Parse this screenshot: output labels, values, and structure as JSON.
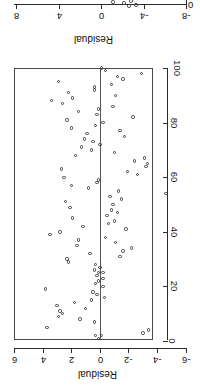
{
  "figure": {
    "orientation": "rotated-90-clockwise",
    "background": "#ffffff",
    "ink_color": "#2b2b2b",
    "marker_color": "#3a3a3a",
    "zero_line_color": "#555555"
  },
  "top_panel": {
    "note": "partially clipped plot at top of image",
    "axis_title": "Residual",
    "tick_labels": [
      "8",
      "4",
      "0",
      "-4",
      "-8"
    ],
    "tick_positions_px": [
      16,
      59,
      101,
      144,
      186
    ],
    "right_edge_label": "0",
    "points_px": [
      {
        "x": 113,
        "y": 2
      },
      {
        "x": 124,
        "y": 3
      },
      {
        "x": 129,
        "y": 6
      },
      {
        "x": 131,
        "y": 1
      },
      {
        "x": 136,
        "y": 5
      }
    ]
  },
  "main_panel": {
    "x_axis": {
      "title": "Residual",
      "tick_labels": [
        "6",
        "4",
        "2",
        "0",
        "-2",
        "-4",
        "-6"
      ],
      "tick_values": [
        6,
        4,
        2,
        0,
        -2,
        -4,
        -6
      ],
      "tick_positions_px": [
        14,
        43,
        71,
        100,
        128,
        157,
        186
      ],
      "range": [
        6,
        -6
      ]
    },
    "y_axis": {
      "title": "Case number",
      "tick_labels": [
        "100",
        "80",
        "60",
        "40",
        "20",
        "0"
      ],
      "tick_values": [
        100,
        80,
        60,
        40,
        20,
        0
      ],
      "tick_positions_px": [
        12,
        67,
        121,
        176,
        230,
        285
      ],
      "range": [
        100,
        0
      ]
    },
    "zero_reference_label": "0"
  },
  "chart_data": {
    "type": "scatter",
    "title": "",
    "xlabel": "Residual",
    "ylabel": "Case number",
    "xlim": [
      -6,
      6
    ],
    "ylim": [
      0,
      100
    ],
    "grid": false,
    "legend": null,
    "reference_line": {
      "axis": "residual",
      "value": 0
    },
    "series": [
      {
        "name": "residuals",
        "marker": "open-circle",
        "points": [
          {
            "case": 1,
            "residual": 0.1
          },
          {
            "case": 2,
            "residual": -0.1
          },
          {
            "case": 2,
            "residual": 0.3
          },
          {
            "case": 3,
            "residual": -3.0
          },
          {
            "case": 4,
            "residual": -3.4
          },
          {
            "case": 5,
            "residual": 3.7
          },
          {
            "case": 7,
            "residual": 0.4
          },
          {
            "case": 8,
            "residual": 1.4
          },
          {
            "case": 9,
            "residual": 2.9
          },
          {
            "case": 10,
            "residual": 2.6
          },
          {
            "case": 11,
            "residual": 2.8
          },
          {
            "case": 12,
            "residual": 1.0
          },
          {
            "case": 13,
            "residual": 3.0
          },
          {
            "case": 14,
            "residual": 1.8
          },
          {
            "case": 15,
            "residual": 0.6
          },
          {
            "case": 16,
            "residual": -0.3
          },
          {
            "case": 17,
            "residual": 0.2
          },
          {
            "case": 18,
            "residual": 0.5
          },
          {
            "case": 19,
            "residual": 3.8
          },
          {
            "case": 20,
            "residual": -0.2
          },
          {
            "case": 21,
            "residual": 0.3
          },
          {
            "case": 22,
            "residual": 0.1
          },
          {
            "case": 23,
            "residual": -0.2
          },
          {
            "case": 24,
            "residual": 0.2
          },
          {
            "case": 25,
            "residual": 0.1
          },
          {
            "case": 25,
            "residual": -0.2
          },
          {
            "case": 26,
            "residual": 0.4
          },
          {
            "case": 27,
            "residual": 0.0
          },
          {
            "case": 28,
            "residual": 0.3
          },
          {
            "case": 29,
            "residual": 2.2
          },
          {
            "case": 30,
            "residual": 2.3
          },
          {
            "case": 31,
            "residual": -1.4
          },
          {
            "case": 32,
            "residual": 0.7
          },
          {
            "case": 33,
            "residual": -1.6
          },
          {
            "case": 34,
            "residual": -2.2
          },
          {
            "case": 35,
            "residual": 1.6
          },
          {
            "case": 36,
            "residual": -1.1
          },
          {
            "case": 37,
            "residual": 1.5
          },
          {
            "case": 38,
            "residual": -0.4
          },
          {
            "case": 39,
            "residual": 3.5
          },
          {
            "case": 40,
            "residual": 2.8
          },
          {
            "case": 41,
            "residual": -1.8
          },
          {
            "case": 42,
            "residual": 1.2
          },
          {
            "case": 43,
            "residual": -0.6
          },
          {
            "case": 44,
            "residual": -1.0
          },
          {
            "case": 45,
            "residual": 1.9
          },
          {
            "case": 46,
            "residual": -0.5
          },
          {
            "case": 47,
            "residual": -1.2
          },
          {
            "case": 48,
            "residual": -0.8
          },
          {
            "case": 49,
            "residual": 2.1
          },
          {
            "case": 50,
            "residual": -0.9
          },
          {
            "case": 51,
            "residual": 2.4
          },
          {
            "case": 52,
            "residual": -1.5
          },
          {
            "case": 53,
            "residual": -0.7
          },
          {
            "case": 54,
            "residual": -4.6
          },
          {
            "case": 55,
            "residual": -1.3
          },
          {
            "case": 56,
            "residual": 0.8
          },
          {
            "case": 57,
            "residual": 2.0
          },
          {
            "case": 58,
            "residual": 0.2
          },
          {
            "case": 59,
            "residual": 0.1
          },
          {
            "case": 60,
            "residual": 2.5
          },
          {
            "case": 61,
            "residual": -2.6
          },
          {
            "case": 62,
            "residual": -1.9
          },
          {
            "case": 63,
            "residual": 2.7
          },
          {
            "case": 64,
            "residual": -3.2
          },
          {
            "case": 65,
            "residual": -3.3
          },
          {
            "case": 66,
            "residual": -2.4
          },
          {
            "case": 67,
            "residual": -3.1
          },
          {
            "case": 68,
            "residual": 1.7
          },
          {
            "case": 69,
            "residual": -1.0
          },
          {
            "case": 70,
            "residual": 0.6
          },
          {
            "case": 71,
            "residual": 1.3
          },
          {
            "case": 72,
            "residual": 0.0
          },
          {
            "case": 73,
            "residual": 0.5
          },
          {
            "case": 74,
            "residual": 1.1
          },
          {
            "case": 75,
            "residual": -1.7
          },
          {
            "case": 76,
            "residual": 0.9
          },
          {
            "case": 77,
            "residual": -1.4
          },
          {
            "case": 78,
            "residual": 2.0
          },
          {
            "case": 79,
            "residual": 0.3
          },
          {
            "case": 80,
            "residual": -0.2
          },
          {
            "case": 81,
            "residual": 2.3
          },
          {
            "case": 82,
            "residual": -2.3
          },
          {
            "case": 83,
            "residual": 0.2
          },
          {
            "case": 84,
            "residual": 1.5
          },
          {
            "case": 85,
            "residual": 0.1
          },
          {
            "case": 86,
            "residual": -0.9
          },
          {
            "case": 87,
            "residual": 2.6
          },
          {
            "case": 88,
            "residual": 3.4
          },
          {
            "case": 89,
            "residual": 1.9
          },
          {
            "case": 90,
            "residual": -1.1
          },
          {
            "case": 91,
            "residual": 2.2
          },
          {
            "case": 92,
            "residual": 0.4
          },
          {
            "case": 93,
            "residual": 0.4
          },
          {
            "case": 94,
            "residual": -0.8
          },
          {
            "case": 95,
            "residual": 2.9
          },
          {
            "case": 96,
            "residual": -1.6
          },
          {
            "case": 97,
            "residual": -1.2
          },
          {
            "case": 98,
            "residual": -2.9
          },
          {
            "case": 99,
            "residual": -0.4
          },
          {
            "case": 100,
            "residual": -0.1
          }
        ]
      }
    ]
  }
}
